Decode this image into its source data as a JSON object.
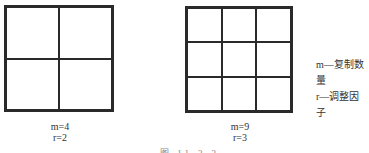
{
  "figures": [
    {
      "id": "left",
      "rows": 2,
      "cols": 2,
      "m_label": "m=4",
      "r_label": "r=2"
    },
    {
      "id": "right",
      "rows": 3,
      "cols": 3,
      "m_label": "m=9",
      "r_label": "r=3"
    }
  ],
  "legend": {
    "m": "m—复制数量",
    "r": "r—调整因子"
  },
  "caption": "图  11-3-3",
  "colors": {
    "line": "#2a2a2a",
    "text": "#333333",
    "background": "#ffffff"
  }
}
